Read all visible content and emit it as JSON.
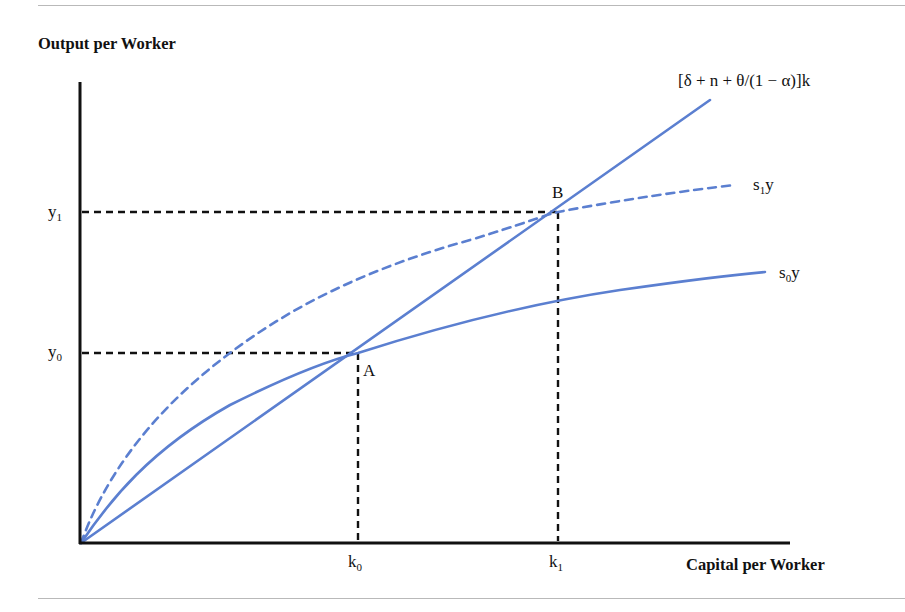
{
  "figure": {
    "y_axis_title": "Output per Worker",
    "x_axis_title": "Capital per Worker",
    "curves": {
      "depreciation_line": {
        "label": "[δ + n + θ/(1 − α)]k",
        "style": "solid"
      },
      "s1y": {
        "base": "s",
        "sub": "1",
        "tail": "y",
        "style": "dashed"
      },
      "s0y": {
        "base": "s",
        "sub": "0",
        "tail": "y",
        "style": "solid"
      }
    },
    "points": {
      "A": {
        "label": "A"
      },
      "B": {
        "label": "B"
      }
    },
    "y_ticks": [
      {
        "base": "y",
        "sub": "1"
      },
      {
        "base": "y",
        "sub": "0"
      }
    ],
    "x_ticks": [
      {
        "base": "k",
        "sub": "0"
      },
      {
        "base": "k",
        "sub": "1"
      }
    ],
    "colors": {
      "curve": "#5b7fd0",
      "axis": "#111111",
      "guide": "#111111",
      "rule": "#b9b9b9"
    }
  }
}
